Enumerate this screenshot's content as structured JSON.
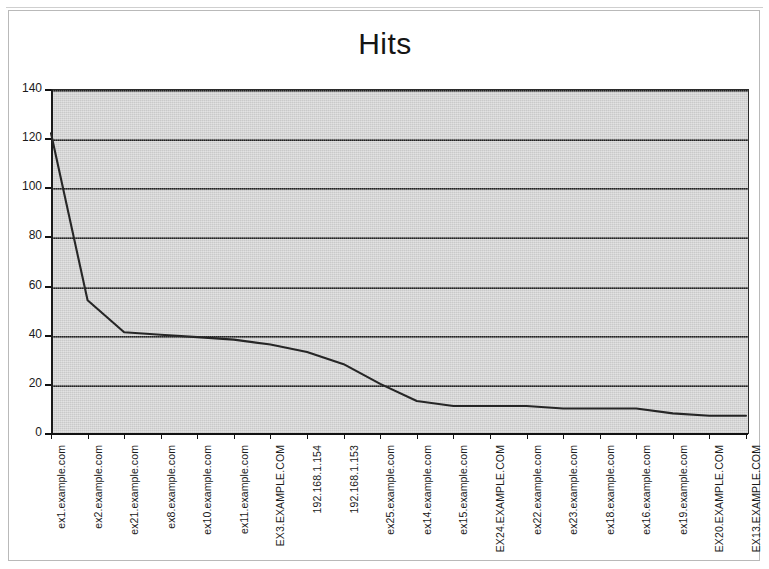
{
  "window": {
    "background_color": "#ffffff",
    "frame_border_color": "#b9b9b9"
  },
  "chart_data": {
    "type": "line",
    "title": "Hits",
    "xlabel": "",
    "ylabel": "",
    "ylim": [
      0,
      140
    ],
    "ytick_step": 20,
    "yticks": [
      "0",
      "20",
      "40",
      "60",
      "80",
      "100",
      "120",
      "140"
    ],
    "grid": true,
    "grid_axis": "y",
    "legend": false,
    "plot_background_color": "#c9c9c9",
    "line_color": "#262626",
    "categories": [
      "ex1.example.com",
      "ex2.example.com",
      "ex21.example.com",
      "ex8.example.com",
      "ex10.example.com",
      "ex11.example.com",
      "EX3.EXAMPLE.COM",
      "192.168.1.154",
      "192.168.1.153",
      "ex25.example.com",
      "ex14.example.com",
      "ex15.example.com",
      "EX24.EXAMPLE.COM",
      "ex22.example.com",
      "ex23.example.com",
      "ex18.example.com",
      "ex16.example.com",
      "ex19.example.com",
      "EX20.EXAMPLE.COM",
      "EX13.EXAMPLE.COM"
    ],
    "values": [
      122,
      54,
      41,
      40,
      39,
      38,
      36,
      33,
      28,
      20,
      13,
      11,
      11,
      11,
      10,
      10,
      10,
      8,
      7,
      7
    ],
    "series": [
      {
        "name": "Hits",
        "values": [
          122,
          54,
          41,
          40,
          39,
          38,
          36,
          33,
          28,
          20,
          13,
          11,
          11,
          11,
          10,
          10,
          10,
          8,
          7,
          7
        ]
      }
    ]
  }
}
